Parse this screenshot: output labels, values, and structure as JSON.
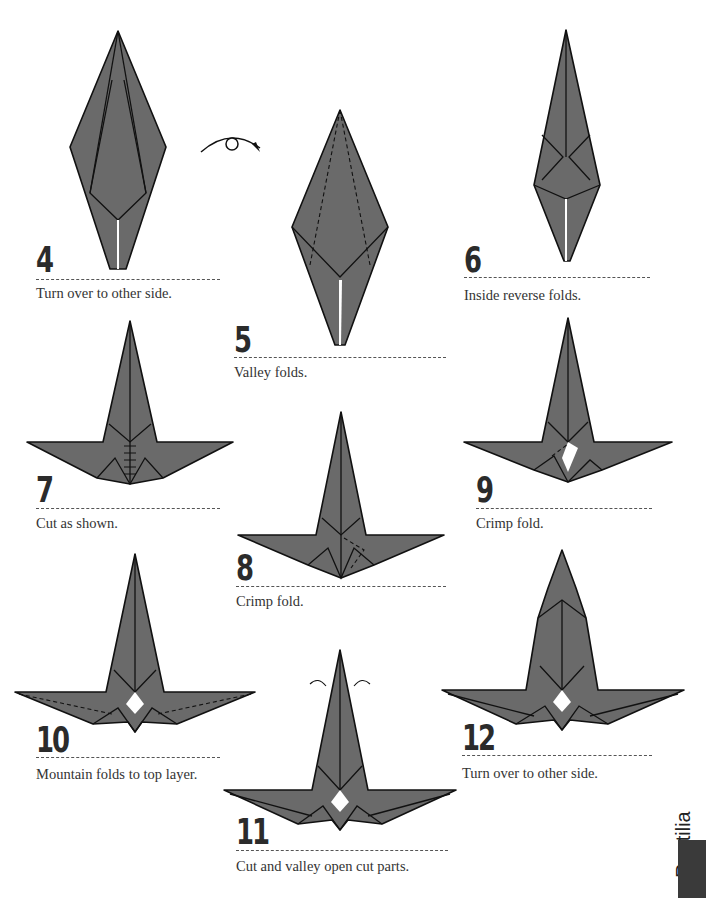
{
  "page": {
    "section_label": "Reptilia",
    "paper_color": "#6a6a6a",
    "line_color": "#111111"
  },
  "steps": [
    {
      "number": "4",
      "caption": "Turn over to other side.",
      "symbol": "turn-over-icon"
    },
    {
      "number": "5",
      "caption": "Valley folds."
    },
    {
      "number": "6",
      "caption": "Inside reverse folds."
    },
    {
      "number": "7",
      "caption": "Cut as shown."
    },
    {
      "number": "8",
      "caption": "Crimp fold."
    },
    {
      "number": "9",
      "caption": "Crimp fold."
    },
    {
      "number": "10",
      "caption": "Mountain folds to top layer."
    },
    {
      "number": "11",
      "caption": "Cut and valley open cut parts."
    },
    {
      "number": "12",
      "caption": "Turn over to other side."
    }
  ]
}
